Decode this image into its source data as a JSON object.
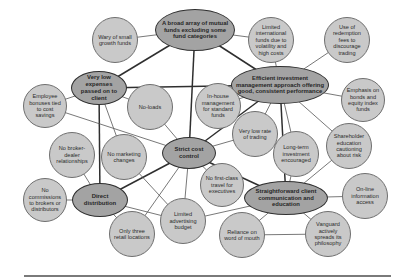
{
  "diagram": {
    "title": "",
    "colors": {
      "core_fill": "#a3a3a3",
      "core_stroke": "#2f2f2f",
      "leaf_fill": "#c9c9c9",
      "leaf_stroke": "#6f6f6f",
      "line": "#2f2f2f"
    },
    "nodes": [
      {
        "id": "broad-array",
        "type": "core",
        "label": "A broad array of mutual funds excluding some fund categories",
        "x": 195,
        "y": 30,
        "rx": 40,
        "ry": 21
      },
      {
        "id": "very-low-expenses",
        "type": "core",
        "label": "Very low expenses passed on to client",
        "x": 99,
        "y": 88,
        "rx": 28,
        "ry": 17
      },
      {
        "id": "efficient-investment",
        "type": "core",
        "label": "Efficient investment management approach offering good, consistent performance",
        "x": 280,
        "y": 85,
        "rx": 49,
        "ry": 19
      },
      {
        "id": "strict-cost-control",
        "type": "core",
        "label": "Strict cost control",
        "x": 189,
        "y": 153,
        "rx": 27,
        "ry": 16
      },
      {
        "id": "direct-distribution",
        "type": "core",
        "label": "Direct distribution",
        "x": 100,
        "y": 200,
        "rx": 28,
        "ry": 17
      },
      {
        "id": "straightforward-client",
        "type": "core",
        "label": "Straightforward client communication and education",
        "x": 286,
        "y": 198,
        "rx": 42,
        "ry": 17
      },
      {
        "id": "wary-small-growth",
        "type": "leaf",
        "label": "Wary of small growth funds",
        "x": 115,
        "y": 40,
        "r": 23
      },
      {
        "id": "limited-international",
        "type": "leaf",
        "label": "Limited international funds due to volatility and high costs",
        "x": 271,
        "y": 40,
        "r": 23
      },
      {
        "id": "redemption-fees",
        "type": "leaf",
        "label": "Use of redemption fees to discourage trading",
        "x": 347,
        "y": 40,
        "r": 23
      },
      {
        "id": "employee-bonuses",
        "type": "leaf",
        "label": "Employee bonuses tied to cost savings",
        "x": 45,
        "y": 106,
        "r": 22
      },
      {
        "id": "no-loads",
        "type": "leaf",
        "label": "No-loads",
        "x": 150,
        "y": 107,
        "r": 23
      },
      {
        "id": "in-house-management",
        "type": "leaf",
        "label": "In-house management for standard funds",
        "x": 218,
        "y": 106,
        "r": 23
      },
      {
        "id": "emphasis-bonds",
        "type": "leaf",
        "label": "Emphasis on bonds and equity index funds",
        "x": 363,
        "y": 100,
        "r": 22
      },
      {
        "id": "low-rate-trading",
        "type": "leaf",
        "label": "Very low rate of trading",
        "x": 255,
        "y": 134,
        "r": 23
      },
      {
        "id": "no-broker-dealer",
        "type": "leaf",
        "label": "No broker-dealer relationships",
        "x": 72,
        "y": 155,
        "r": 23
      },
      {
        "id": "no-marketing-changes",
        "type": "leaf",
        "label": "No marketing changes",
        "x": 124,
        "y": 157,
        "r": 23
      },
      {
        "id": "long-term-investment",
        "type": "leaf",
        "label": "Long-term investment encouraged",
        "x": 296,
        "y": 154,
        "r": 23
      },
      {
        "id": "shareholder-education",
        "type": "leaf",
        "label": "Shareholder education cautioning about risk",
        "x": 349,
        "y": 146,
        "r": 23
      },
      {
        "id": "no-first-class",
        "type": "leaf",
        "label": "No first-class travel for executives",
        "x": 222,
        "y": 185,
        "r": 22
      },
      {
        "id": "no-commissions",
        "type": "leaf",
        "label": "No commissions to brokers or distributors",
        "x": 45,
        "y": 200,
        "r": 22
      },
      {
        "id": "online-information",
        "type": "leaf",
        "label": "On-line information access",
        "x": 365,
        "y": 196,
        "r": 23
      },
      {
        "id": "limited-advertising",
        "type": "leaf",
        "label": "Limited advertising budget",
        "x": 183,
        "y": 221,
        "r": 23
      },
      {
        "id": "three-retail",
        "type": "leaf",
        "label": "Only three retail locations",
        "x": 132,
        "y": 234,
        "r": 23
      },
      {
        "id": "word-of-mouth",
        "type": "leaf",
        "label": "Reliance on word of mouth",
        "x": 242,
        "y": 235,
        "r": 23
      },
      {
        "id": "vanguard-philosophy",
        "type": "leaf",
        "label": "Vanguard actively spreads its philosophy",
        "x": 328,
        "y": 234,
        "r": 23
      }
    ],
    "edges": [
      {
        "from": "wary-small-growth",
        "to": "broad-array",
        "weight": "thin"
      },
      {
        "from": "broad-array",
        "to": "limited-international",
        "weight": "thin"
      },
      {
        "from": "broad-array",
        "to": "very-low-expenses",
        "weight": "thick"
      },
      {
        "from": "broad-array",
        "to": "efficient-investment",
        "weight": "thick"
      },
      {
        "from": "broad-array",
        "to": "strict-cost-control",
        "weight": "thick"
      },
      {
        "from": "limited-international",
        "to": "efficient-investment",
        "weight": "thin"
      },
      {
        "from": "redemption-fees",
        "to": "efficient-investment",
        "weight": "thin"
      },
      {
        "from": "very-low-expenses",
        "to": "efficient-investment",
        "weight": "thick"
      },
      {
        "from": "very-low-expenses",
        "to": "employee-bonuses",
        "weight": "thin"
      },
      {
        "from": "very-low-expenses",
        "to": "no-loads",
        "weight": "thin"
      },
      {
        "from": "very-low-expenses",
        "to": "direct-distribution",
        "weight": "thick"
      },
      {
        "from": "very-low-expenses",
        "to": "no-marketing-changes",
        "weight": "thin"
      },
      {
        "from": "employee-bonuses",
        "to": "strict-cost-control",
        "weight": "thin"
      },
      {
        "from": "no-loads",
        "to": "strict-cost-control",
        "weight": "thin"
      },
      {
        "from": "in-house-management",
        "to": "efficient-investment",
        "weight": "thin"
      },
      {
        "from": "efficient-investment",
        "to": "emphasis-bonds",
        "weight": "thin"
      },
      {
        "from": "efficient-investment",
        "to": "strict-cost-control",
        "weight": "thick"
      },
      {
        "from": "efficient-investment",
        "to": "low-rate-trading",
        "weight": "thin"
      },
      {
        "from": "efficient-investment",
        "to": "long-term-investment",
        "weight": "thin"
      },
      {
        "from": "efficient-investment",
        "to": "straightforward-client",
        "weight": "thick"
      },
      {
        "from": "efficient-investment",
        "to": "shareholder-education",
        "weight": "thin"
      },
      {
        "from": "strict-cost-control",
        "to": "low-rate-trading",
        "weight": "thin"
      },
      {
        "from": "strict-cost-control",
        "to": "direct-distribution",
        "weight": "thick"
      },
      {
        "from": "strict-cost-control",
        "to": "straightforward-client",
        "weight": "thick"
      },
      {
        "from": "strict-cost-control",
        "to": "no-first-class",
        "weight": "thin"
      },
      {
        "from": "strict-cost-control",
        "to": "limited-advertising",
        "weight": "thin"
      },
      {
        "from": "strict-cost-control",
        "to": "three-retail",
        "weight": "thin"
      },
      {
        "from": "no-broker-dealer",
        "to": "direct-distribution",
        "weight": "thin"
      },
      {
        "from": "no-marketing-changes",
        "to": "limited-advertising",
        "weight": "thin"
      },
      {
        "from": "no-commissions",
        "to": "direct-distribution",
        "weight": "thin"
      },
      {
        "from": "direct-distribution",
        "to": "limited-advertising",
        "weight": "thin"
      },
      {
        "from": "direct-distribution",
        "to": "three-retail",
        "weight": "thin"
      },
      {
        "from": "long-term-investment",
        "to": "straightforward-client",
        "weight": "thin"
      },
      {
        "from": "shareholder-education",
        "to": "straightforward-client",
        "weight": "thin"
      },
      {
        "from": "straightforward-client",
        "to": "online-information",
        "weight": "thin"
      },
      {
        "from": "straightforward-client",
        "to": "word-of-mouth",
        "weight": "thin"
      },
      {
        "from": "straightforward-client",
        "to": "vanguard-philosophy",
        "weight": "thin"
      },
      {
        "from": "straightforward-client",
        "to": "limited-advertising",
        "weight": "thin"
      },
      {
        "from": "word-of-mouth",
        "to": "vanguard-philosophy",
        "weight": "thin"
      }
    ]
  }
}
